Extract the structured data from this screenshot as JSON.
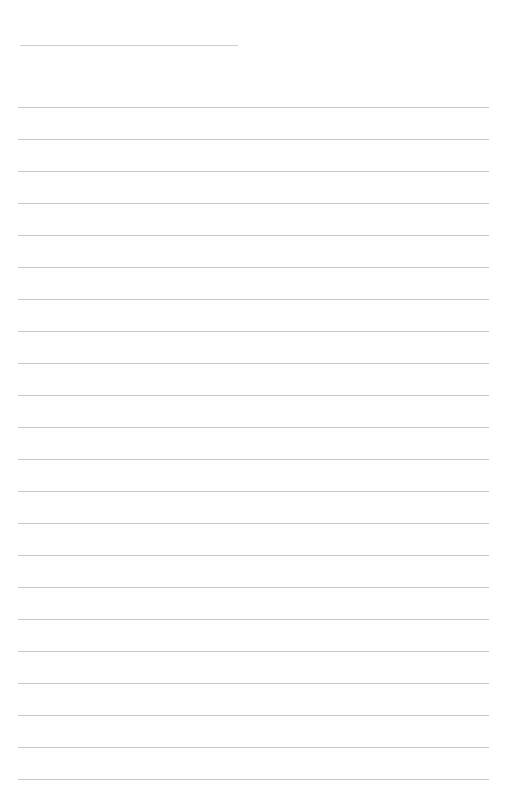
{
  "page": {
    "type": "lined-paper",
    "background": "#ffffff",
    "line_color": "#c9c9c9",
    "title_line": {
      "y": 45,
      "x1": 20,
      "x2": 238
    },
    "ruled_lines": {
      "count": 22,
      "first_y": 107,
      "spacing": 32,
      "x1": 18,
      "x2": 489
    }
  }
}
